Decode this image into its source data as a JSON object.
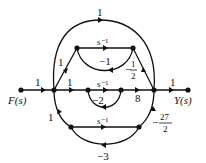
{
  "diagram": {
    "type": "signal-flow-graph",
    "input_label": "F(s)",
    "output_label": "Y(s)",
    "gains": {
      "input_branch": "1",
      "output_branch": "1",
      "top_feedforward": "1",
      "upper_in": "1",
      "upper_forward": "s⁻¹",
      "upper_feedback": "−1",
      "upper_out_num": "1",
      "upper_out_sign": "−",
      "upper_out_den": "2",
      "mid_in": "1",
      "mid_forward": "s⁻¹",
      "mid_feedback": "−2",
      "mid_out": "8",
      "lower_in": "1",
      "lower_forward": "s⁻¹",
      "lower_feedback": "−3",
      "lower_out_num": "27",
      "lower_out_sign": "−",
      "lower_out_den": "2"
    }
  }
}
